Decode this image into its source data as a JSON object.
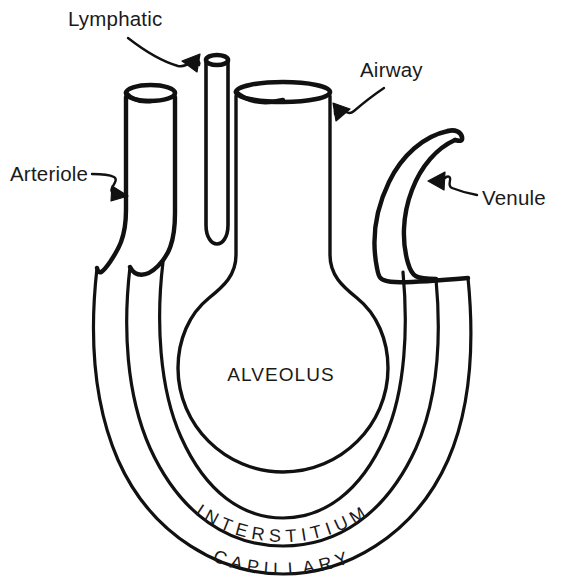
{
  "figure": {
    "kind": "anatomical-diagram",
    "background_color": "#ffffff",
    "line_color": "#111111"
  },
  "callouts": [
    {
      "id": "lymphatic",
      "label": "Lymphatic",
      "label_x": 68,
      "label_y": 26,
      "points_to": "lymphatic-tube",
      "arrow_style": "squiggle-arrow"
    },
    {
      "id": "airway",
      "label": "Airway",
      "label_x": 360,
      "label_y": 77,
      "points_to": "airway-tube",
      "arrow_style": "squiggle-arrow"
    },
    {
      "id": "arteriole",
      "label": "Arteriole",
      "label_x": 10,
      "label_y": 181,
      "points_to": "arteriole-tube",
      "arrow_style": "squiggle-arrow"
    },
    {
      "id": "venule",
      "label": "Venule",
      "label_x": 482,
      "label_y": 205,
      "points_to": "venule-tube",
      "arrow_style": "squiggle-arrow"
    }
  ],
  "regions": [
    {
      "id": "alveolus",
      "label": "ALVEOLUS",
      "text_x": 281,
      "text_y": 381,
      "orientation": "horizontal"
    },
    {
      "id": "interstitium",
      "label": "INTERSTITIUM",
      "orientation": "curved-along-arc",
      "arc_radius": 152
    },
    {
      "id": "capillary",
      "label": "CAPILLARY",
      "orientation": "curved-along-arc",
      "arc_radius": 185
    }
  ],
  "structures": [
    {
      "id": "arteriole-tube",
      "name": "Arteriole"
    },
    {
      "id": "lymphatic-tube",
      "name": "Lymphatic"
    },
    {
      "id": "airway-tube",
      "name": "Airway"
    },
    {
      "id": "venule-tube",
      "name": "Venule"
    },
    {
      "id": "alveolus-chamber",
      "name": "Alveolus"
    },
    {
      "id": "interstitium-ring",
      "name": "Interstitium"
    },
    {
      "id": "capillary-ring",
      "name": "Capillary"
    }
  ]
}
